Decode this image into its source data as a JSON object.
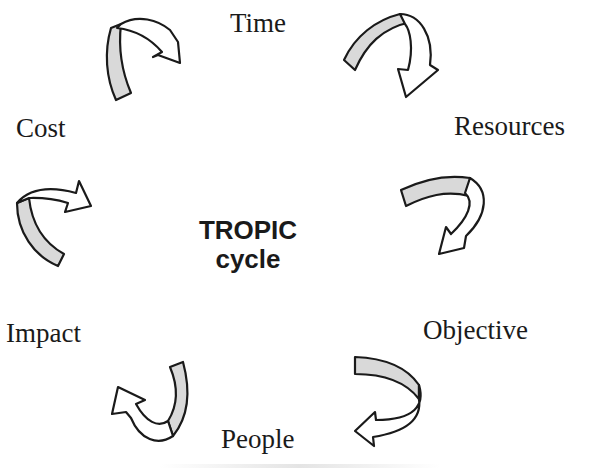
{
  "diagram": {
    "title": "TROPIC cycle",
    "center": {
      "line1": "TROPIC",
      "line2": "cycle"
    },
    "nodes": [
      {
        "id": "time",
        "label": "Time"
      },
      {
        "id": "resources",
        "label": "Resources"
      },
      {
        "id": "objective",
        "label": "Objective"
      },
      {
        "id": "people",
        "label": "People"
      },
      {
        "id": "impact",
        "label": "Impact"
      },
      {
        "id": "cost",
        "label": "Cost"
      }
    ],
    "flow": "clockwise",
    "edges": [
      {
        "from": "Cost",
        "to": "Time"
      },
      {
        "from": "Time",
        "to": "Resources"
      },
      {
        "from": "Resources",
        "to": "Objective"
      },
      {
        "from": "Objective",
        "to": "People"
      },
      {
        "from": "People",
        "to": "Impact"
      },
      {
        "from": "Impact",
        "to": "Cost"
      }
    ],
    "colors": {
      "text": "#1a1a1a",
      "ribbon_fill": "#d9d9d9",
      "background": "#ffffff"
    }
  }
}
